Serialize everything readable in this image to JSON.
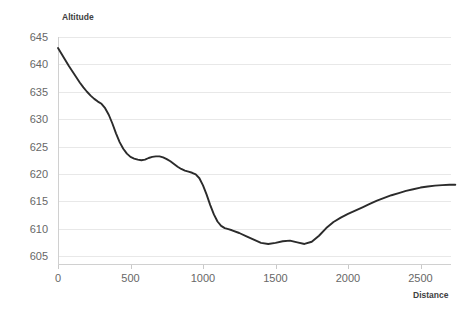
{
  "chart_data": {
    "type": "line",
    "title": "",
    "xlabel": "Distance",
    "ylabel": "Altitude",
    "xlim": [
      0,
      2750
    ],
    "ylim": [
      603,
      646
    ],
    "grid": true,
    "legend": false,
    "legend_position": "none",
    "line_color": "#2b2b2b",
    "grid_color": "#e8e8e8",
    "xticks": [
      0,
      500,
      1000,
      1500,
      2000,
      2500
    ],
    "xtick_labels": [
      "0",
      "500",
      "1000",
      "1500",
      "2000",
      "2500"
    ],
    "yticks": [
      605,
      610,
      615,
      620,
      625,
      630,
      635,
      640,
      645
    ],
    "ytick_labels": [
      "605",
      "610",
      "615",
      "620",
      "625",
      "630",
      "635",
      "640",
      "645"
    ],
    "series": [
      {
        "name": "Altitude profile",
        "x": [
          0,
          25,
          50,
          75,
          100,
          125,
          150,
          175,
          200,
          225,
          250,
          275,
          300,
          325,
          350,
          375,
          400,
          425,
          450,
          475,
          500,
          525,
          550,
          575,
          600,
          625,
          650,
          675,
          700,
          725,
          750,
          775,
          800,
          825,
          850,
          875,
          900,
          925,
          950,
          975,
          1000,
          1025,
          1050,
          1075,
          1100,
          1125,
          1150,
          1175,
          1200,
          1250,
          1300,
          1350,
          1400,
          1450,
          1500,
          1550,
          1600,
          1650,
          1700,
          1750,
          1800,
          1850,
          1900,
          1950,
          2000,
          2050,
          2100,
          2150,
          2200,
          2250,
          2300,
          2350,
          2400,
          2450,
          2500,
          2550,
          2600,
          2650,
          2700,
          2740
        ],
        "y": [
          643.0,
          641.9,
          640.8,
          639.7,
          638.7,
          637.7,
          636.7,
          635.8,
          635.0,
          634.3,
          633.7,
          633.2,
          632.8,
          632.0,
          630.8,
          629.2,
          627.4,
          625.8,
          624.6,
          623.7,
          623.1,
          622.8,
          622.6,
          622.5,
          622.6,
          622.9,
          623.1,
          623.2,
          623.2,
          623.0,
          622.7,
          622.3,
          621.8,
          621.3,
          620.9,
          620.6,
          620.4,
          620.2,
          619.9,
          619.2,
          617.9,
          616.2,
          614.3,
          612.6,
          611.3,
          610.5,
          610.1,
          609.9,
          609.7,
          609.2,
          608.6,
          608.0,
          607.4,
          607.2,
          607.4,
          607.7,
          607.8,
          607.5,
          607.2,
          607.6,
          608.7,
          610.1,
          611.2,
          612.0,
          612.7,
          613.3,
          613.9,
          614.5,
          615.1,
          615.6,
          616.1,
          616.5,
          616.9,
          617.2,
          617.5,
          617.7,
          617.85,
          617.95,
          618.0,
          618.0
        ]
      }
    ]
  }
}
